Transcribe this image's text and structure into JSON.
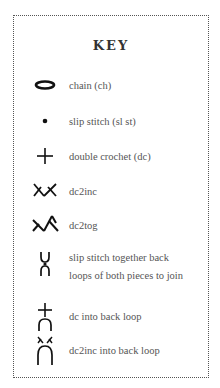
{
  "key": {
    "title": "KEY",
    "items": [
      {
        "icon": "chain-icon",
        "label": "chain (ch)"
      },
      {
        "icon": "slip-stitch-icon",
        "label": "slip stitch (sl st)"
      },
      {
        "icon": "double-crochet-icon",
        "label": "double crochet (dc)"
      },
      {
        "icon": "dc2inc-icon",
        "label": "dc2inc"
      },
      {
        "icon": "dc2tog-icon",
        "label": "dc2tog"
      },
      {
        "icon": "slip-stitch-together-back-loops-icon",
        "label_line1": "slip stitch together back",
        "label_line2": "loops of both pieces to join"
      },
      {
        "icon": "dc-back-loop-icon",
        "label": "dc into back loop"
      },
      {
        "icon": "dc2inc-back-loop-icon",
        "label": "dc2inc into back loop"
      }
    ]
  }
}
